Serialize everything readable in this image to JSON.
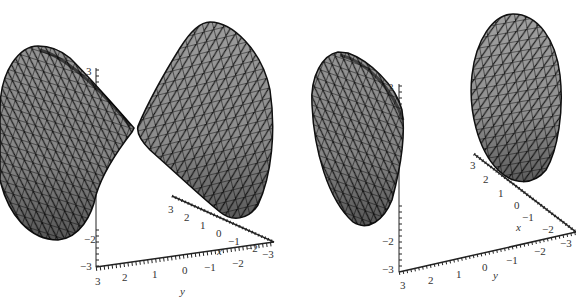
{
  "figure": {
    "colors": {
      "mesh_fill": "#9a9a9a",
      "mesh_line": "#111111",
      "axis": "#222222",
      "label": "#333333"
    },
    "panels": [
      {
        "id": "left",
        "surface": "two opposing cone-like sheets meeting near apex",
        "z_axis": {
          "ticks": [
            "3",
            "3",
            "-2",
            "-3"
          ]
        },
        "x_axis": {
          "ticks": [
            "3",
            "2",
            "1",
            "0",
            "-1",
            "-2",
            "-3"
          ],
          "name": "x"
        },
        "y_axis": {
          "ticks": [
            "3",
            "2",
            "1",
            "0",
            "-1",
            "-2",
            "-3"
          ],
          "name": "y"
        }
      },
      {
        "id": "right",
        "surface": "two separated bowl-shaped sheets",
        "z_axis": {
          "ticks": [
            "3",
            "3",
            "-2",
            "-3"
          ]
        },
        "x_axis": {
          "ticks": [
            "3",
            "2",
            "1",
            "0",
            "-1",
            "-2",
            "-3"
          ],
          "name": "x"
        },
        "y_axis": {
          "ticks": [
            "3",
            "2",
            "1",
            "0",
            "-1",
            "-2",
            "-3"
          ],
          "name": "y"
        }
      }
    ]
  }
}
